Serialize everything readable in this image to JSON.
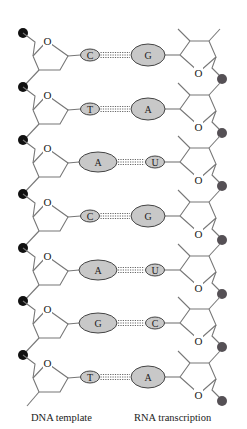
{
  "diagram": {
    "colors": {
      "background": "#ffffff",
      "backbone_line": "#777777",
      "dna_phosphate": "#111111",
      "rna_phosphate": "#555055",
      "base_fill": "#c8c8c8",
      "base_stroke": "#444444",
      "hbond": "#666666",
      "text": "#222222"
    },
    "pairs": [
      {
        "dna": "C",
        "rna": "G",
        "dna_size": "small",
        "rna_size": "large"
      },
      {
        "dna": "T",
        "rna": "A",
        "dna_size": "small",
        "rna_size": "large"
      },
      {
        "dna": "A",
        "rna": "U",
        "dna_size": "large",
        "rna_size": "small"
      },
      {
        "dna": "C",
        "rna": "G",
        "dna_size": "small",
        "rna_size": "large"
      },
      {
        "dna": "A",
        "rna": "U",
        "dna_size": "large",
        "rna_size": "small"
      },
      {
        "dna": "G",
        "rna": "C",
        "dna_size": "large",
        "rna_size": "small"
      },
      {
        "dna": "T",
        "rna": "A",
        "dna_size": "small",
        "rna_size": "large"
      }
    ],
    "ring_oxygen_label": "O"
  },
  "captions": {
    "dna": "DNA template",
    "rna": "RNA transcription"
  }
}
